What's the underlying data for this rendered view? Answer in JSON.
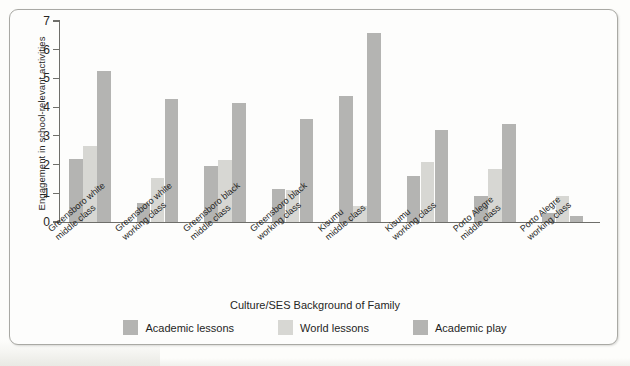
{
  "figure": {
    "frame_color": "#a9a9a4",
    "page_background": "#fdfdfb"
  },
  "chart_data": {
    "type": "bar",
    "title": "",
    "xlabel": "Culture/SES Background of Family",
    "ylabel": "Engagement in school-relevant activities",
    "ylim": [
      0,
      7
    ],
    "yticks": [
      0,
      1,
      2,
      3,
      4,
      5,
      6,
      7
    ],
    "ytick_labels": [
      "0",
      "1",
      "2",
      "3",
      "4",
      "5",
      "6",
      "7"
    ],
    "grid": false,
    "legend_position": "bottom-center",
    "categories": [
      "Greensboro white\nmiddle class",
      "Greensboro white\nworking class",
      "Greensboro black\nmiddle class",
      "Greensboro black\nworking class",
      "Kisumu\nmiddle class",
      "Kisumu\nworking class",
      "Porto Alegre\nmiddle class",
      "Porto Alegre\nworking class"
    ],
    "series": [
      {
        "name": "Academic lessons",
        "color": "#b4b4b2",
        "values": [
          2.2,
          0.65,
          1.95,
          1.15,
          4.4,
          1.6,
          0.9,
          0.3
        ]
      },
      {
        "name": "World lessons",
        "color": "#d7d7d3",
        "values": [
          2.65,
          1.55,
          2.15,
          1.1,
          0.55,
          2.1,
          1.85,
          0.9
        ]
      },
      {
        "name": "Academic play",
        "color": "#b4b4b2",
        "values": [
          5.25,
          4.3,
          4.15,
          3.6,
          6.6,
          3.2,
          3.4,
          0.2
        ]
      }
    ]
  }
}
